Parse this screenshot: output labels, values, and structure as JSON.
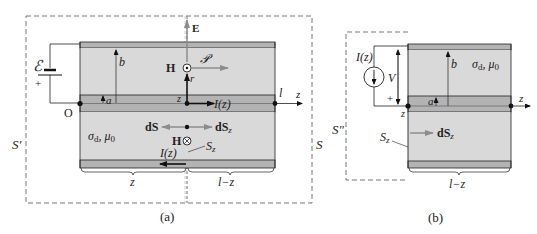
{
  "figure_a": {
    "caption": "(a)",
    "emf_label": "ℰ",
    "plus_label": "+",
    "origin_label": "O",
    "b_label": "b",
    "a_label": "a",
    "E_label": "E",
    "H_top_label": "H",
    "poynting_label": "𝒫",
    "r_label": "r",
    "z_point_label": "z",
    "current_label": "I(z)",
    "current_return_label": "I(z)",
    "l_label": "l",
    "z_axis_label": "z",
    "material_label": "σd, μ0",
    "material_sigma": "σ",
    "material_sub_d": "d",
    "material_mu": ", μ",
    "material_sub_0": "0",
    "dS_label": "dS",
    "dSz_label": "dS",
    "dSz_sub": "z",
    "H_bottom_label": "H",
    "Sz_label": "S",
    "Sz_sub": "z",
    "S_prime_label": "S′",
    "S_label": "S",
    "bracket_left_label": "z",
    "bracket_right_label": "l−z"
  },
  "figure_b": {
    "caption": "(b)",
    "source_label": "I(z)",
    "V_label": "V",
    "plus_label": "+",
    "b_label": "b",
    "a_label": "a",
    "material_sigma": "σ",
    "material_sub_d": "d",
    "material_mu": ", μ",
    "material_sub_0": "0",
    "z_point_label": "z",
    "z_axis_label": "z",
    "S_double_prime_label": "S″",
    "Sz_label": "S",
    "Sz_sub": "z",
    "dSz_label": "dS",
    "dSz_sub": "z",
    "bracket_label": "l−z"
  },
  "colors": {
    "dielectric": "#d9d9d9",
    "conductor": "#b3b3b3",
    "line": "#222222",
    "arrow_gray": "#8c8c8c",
    "dashed": "#777777"
  }
}
